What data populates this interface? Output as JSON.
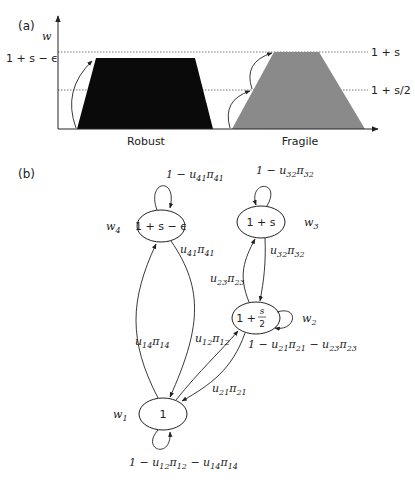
{
  "panel_a": {
    "label": "(a)",
    "y_axis_label": "w",
    "levels": {
      "robust_peak": "1 + s − ϵ",
      "fragile_peak": "1 + s",
      "fragile_mid": "1 + s/2"
    },
    "categories": {
      "robust": "Robust",
      "fragile": "Fragile"
    },
    "colors": {
      "robust_fill": "#0a0a0a",
      "fragile_fill": "#8a8a8a",
      "dotted_line": "#555555"
    }
  },
  "panel_b": {
    "label": "(b)",
    "nodes": {
      "n1": {
        "value": "1",
        "weight": "w",
        "weight_sub": "1"
      },
      "n2": {
        "value_main": "1 + ",
        "value_num": "s",
        "value_den": "2",
        "weight": "w",
        "weight_sub": "2"
      },
      "n3": {
        "value": "1 + s",
        "weight": "w",
        "weight_sub": "3"
      },
      "n4": {
        "value": "1 + s − ϵ",
        "weight": "w",
        "weight_sub": "4"
      }
    },
    "edges": {
      "self_1": {
        "t1": "1 − u",
        "s1": "12",
        "t2": "π",
        "s2": "12",
        "t3": " − u",
        "s3": "14",
        "t4": "π",
        "s4": "14"
      },
      "self_2": {
        "t1": "1 − u",
        "s1": "21",
        "t2": "π",
        "s2": "21",
        "t3": " − u",
        "s3": "23",
        "t4": "π",
        "s4": "23"
      },
      "self_3": {
        "t1": "1 − u",
        "s1": "32",
        "t2": "π",
        "s2": "32"
      },
      "self_4": {
        "t1": "1 − u",
        "s1": "41",
        "t2": "π",
        "s2": "41"
      },
      "e41": {
        "t1": "u",
        "s1": "41",
        "t2": "π",
        "s2": "41"
      },
      "e32": {
        "t1": "u",
        "s1": "32",
        "t2": "π",
        "s2": "32"
      },
      "e23": {
        "t1": "u",
        "s1": "23",
        "t2": "π",
        "s2": "23"
      },
      "e14": {
        "t1": "u",
        "s1": "14",
        "t2": "π",
        "s2": "14"
      },
      "e12": {
        "t1": "u",
        "s1": "12",
        "t2": "π",
        "s2": "12"
      },
      "e21": {
        "t1": "u",
        "s1": "21",
        "t2": "π",
        "s2": "21"
      }
    }
  }
}
